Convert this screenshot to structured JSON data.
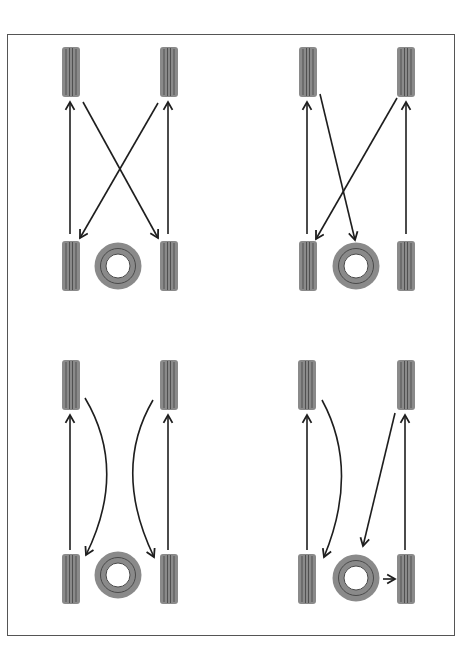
{
  "colors": {
    "tire_fill": "#8a8a8a",
    "tire_groove": "#4a4a4a",
    "arrow": "#1e1e1e",
    "border": "#555555",
    "background": "#ffffff"
  },
  "diagrams": [
    {
      "id": "pattern-1",
      "position": "top-left",
      "description": "Rear tires move straight forward; front tires cross to opposite rear; spare shown unused"
    },
    {
      "id": "pattern-2",
      "position": "top-right",
      "description": "Rear tires move straight forward; front-right crosses to rear-left; front-left crosses to spare position"
    },
    {
      "id": "pattern-3",
      "position": "bottom-left",
      "description": "Rear tires move straight forward; front tires move straight back (curved arrows); spare shown unused"
    },
    {
      "id": "pattern-4",
      "position": "bottom-right",
      "description": "Rear tires move straight forward; front-left moves to rear-left; front-right moves to spare; spare moves to rear-right"
    }
  ]
}
